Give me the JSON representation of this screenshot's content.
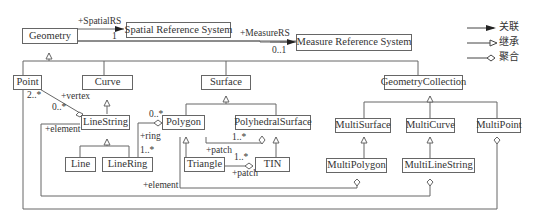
{
  "classes": {
    "geometry": "Geometry",
    "spatial_rs": "Spatial Reference System",
    "measure_rs": "Measure Reference System",
    "point": "Point",
    "curve": "Curve",
    "surface": "Surface",
    "geometry_collection": "GeometryCollection",
    "linestring": "LineString",
    "polygon": "Polygon",
    "polyhedral_surface": "PolyhedralSurface",
    "multi_surface": "MultiSurface",
    "multi_curve": "MultiCurve",
    "multi_point": "MultiPoint",
    "line": "Line",
    "linering": "LineRing",
    "triangle": "Triangle",
    "tin": "TIN",
    "multi_polygon": "MultiPolygon",
    "multi_linestring": "MultiLineString"
  },
  "labels": {
    "spatial_rs_role": "+SpatialRS",
    "spatial_rs_mult": "1",
    "measure_rs_role": "+MeasureRS",
    "measure_rs_mult": "0..1",
    "vertex_mult_point": "2..*",
    "vertex_role": "+vertex",
    "vertex_mult_linestring": "0..*",
    "element_linestring": "+element",
    "ring_mult_polygon": "0..*",
    "ring_role": "+ring",
    "ring_mult_linering": "1..*",
    "patch_mult_polygon": "1..*",
    "patch_role_polygon": "+patch",
    "patch_mult_triangle": "1..*",
    "patch_role_triangle": "+patch",
    "element_polygon": "+element"
  },
  "legend": {
    "association": "关联",
    "inheritance": "继承",
    "aggregation": "聚合"
  }
}
